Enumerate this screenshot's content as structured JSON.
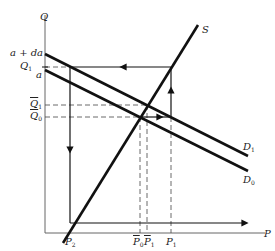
{
  "diagram": {
    "type": "supply-demand shift diagram",
    "axes": {
      "y_label": "Q",
      "x_label": "P"
    },
    "curves": [
      {
        "name": "S",
        "label": "S",
        "description": "upward-sloping supply curve"
      },
      {
        "name": "D1",
        "label": "D",
        "sub": "1",
        "intercept_label": "a + da"
      },
      {
        "name": "D0",
        "label": "D",
        "sub": "0",
        "intercept_label": "a"
      }
    ],
    "y_ticks": [
      {
        "label": "a + da"
      },
      {
        "label": "Q",
        "sub": "1"
      },
      {
        "label": "a"
      },
      {
        "label": "Q",
        "sub": "1",
        "bar": true
      },
      {
        "label": "Q",
        "sub": "0",
        "bar": true
      }
    ],
    "x_ticks": [
      {
        "label": "P",
        "sub": "2"
      },
      {
        "label": "P",
        "sub": "0",
        "bar": true
      },
      {
        "label": "P",
        "sub": "1",
        "bar": true
      },
      {
        "label": "P",
        "sub": "1"
      }
    ],
    "colors": {
      "curve": "#111111",
      "axis": "#555555",
      "dashed": "#444444",
      "background": "#ffffff"
    }
  }
}
